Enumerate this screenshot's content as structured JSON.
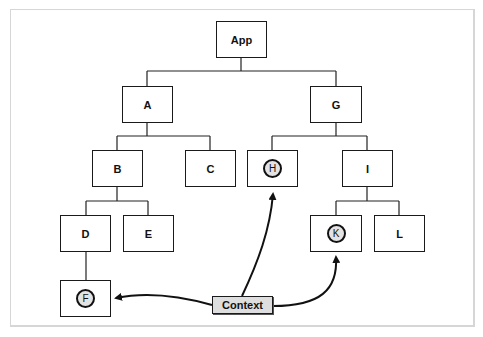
{
  "diagram": {
    "nodes": [
      {
        "id": "app",
        "label": "App",
        "highlighted": false
      },
      {
        "id": "a",
        "label": "A",
        "highlighted": false
      },
      {
        "id": "g",
        "label": "G",
        "highlighted": false
      },
      {
        "id": "b",
        "label": "B",
        "highlighted": false
      },
      {
        "id": "c",
        "label": "C",
        "highlighted": false
      },
      {
        "id": "h",
        "label": "H",
        "highlighted": true
      },
      {
        "id": "i",
        "label": "I",
        "highlighted": false
      },
      {
        "id": "d",
        "label": "D",
        "highlighted": false
      },
      {
        "id": "e",
        "label": "E",
        "highlighted": false
      },
      {
        "id": "k",
        "label": "K",
        "highlighted": true
      },
      {
        "id": "l",
        "label": "L",
        "highlighted": false
      },
      {
        "id": "f",
        "label": "F",
        "highlighted": true
      }
    ],
    "edges": [
      [
        "App",
        "A"
      ],
      [
        "App",
        "G"
      ],
      [
        "A",
        "B"
      ],
      [
        "A",
        "C"
      ],
      [
        "G",
        "H"
      ],
      [
        "G",
        "I"
      ],
      [
        "B",
        "D"
      ],
      [
        "B",
        "E"
      ],
      [
        "I",
        "K"
      ],
      [
        "I",
        "L"
      ],
      [
        "D",
        "F"
      ]
    ],
    "context": {
      "label": "Context",
      "fill": "#dedede",
      "arrows_to": [
        "F",
        "H",
        "K"
      ]
    }
  }
}
